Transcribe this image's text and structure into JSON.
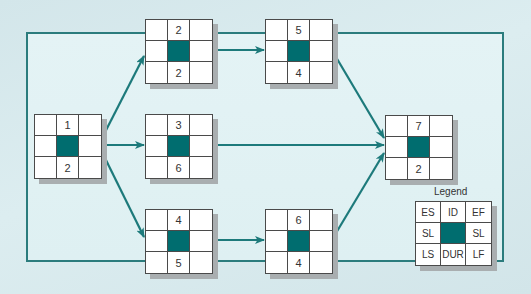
{
  "diagram": {
    "type": "activity-on-node network",
    "colors": {
      "background": "#d6e8ec",
      "frame": "#2b7c7d",
      "arrow": "#1d7a7b",
      "center_cell": "#006d6f",
      "cell_border": "#4a4a4a",
      "shadow": "#a9aeb0"
    },
    "nodes": [
      {
        "id": "1",
        "duration": "2"
      },
      {
        "id": "2",
        "duration": "2"
      },
      {
        "id": "3",
        "duration": "6"
      },
      {
        "id": "4",
        "duration": "5"
      },
      {
        "id": "5",
        "duration": "4"
      },
      {
        "id": "6",
        "duration": "4"
      },
      {
        "id": "7",
        "duration": "2"
      }
    ],
    "edges": [
      {
        "from": "1",
        "to": "2"
      },
      {
        "from": "1",
        "to": "3"
      },
      {
        "from": "1",
        "to": "4"
      },
      {
        "from": "2",
        "to": "5"
      },
      {
        "from": "4",
        "to": "6"
      },
      {
        "from": "5",
        "to": "7"
      },
      {
        "from": "3",
        "to": "7"
      },
      {
        "from": "6",
        "to": "7"
      }
    ],
    "legend": {
      "title": "Legend",
      "top_left": "ES",
      "top_center": "ID",
      "top_right": "EF",
      "middle_left": "SL",
      "middle_right": "SL",
      "bottom_left": "LS",
      "bottom_center": "DUR",
      "bottom_right": "LF"
    }
  }
}
